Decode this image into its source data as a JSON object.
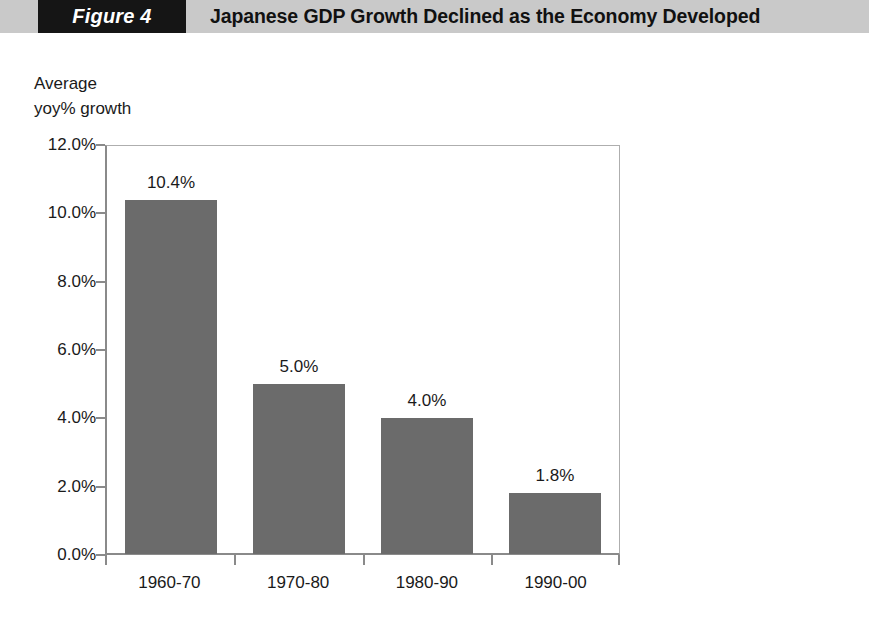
{
  "header": {
    "figure_tag": "Figure 4",
    "title": "Japanese GDP Growth Declined as the Economy Developed",
    "tag_background": "#151515",
    "band_background": "#c9c9c9",
    "tag_text_color": "#ffffff"
  },
  "chart_data": {
    "type": "bar",
    "title": "Japanese GDP Growth Declined as the Economy Developed",
    "caption_line1": "Average",
    "caption_line2": "yoy% growth",
    "xlabel": "",
    "ylabel": "Average yoy% growth",
    "categories": [
      "1960-70",
      "1970-80",
      "1980-90",
      "1990-00"
    ],
    "values": [
      10.4,
      5.0,
      4.0,
      1.8
    ],
    "data_labels": [
      "10.4%",
      "5.0%",
      "4.0%",
      "1.8%"
    ],
    "ylim": [
      0,
      12
    ],
    "ytick_values": [
      12.0,
      10.0,
      8.0,
      6.0,
      4.0,
      2.0,
      0.0
    ],
    "ytick_labels": [
      "12.0%",
      "10.0%",
      "8.0%",
      "6.0%",
      "4.0%",
      "2.0%",
      "0.0%"
    ],
    "grid": false,
    "legend": false,
    "bar_color": "#6b6b6b",
    "axis_color": "#8a8a8a",
    "plot_background": "#ffffff"
  }
}
